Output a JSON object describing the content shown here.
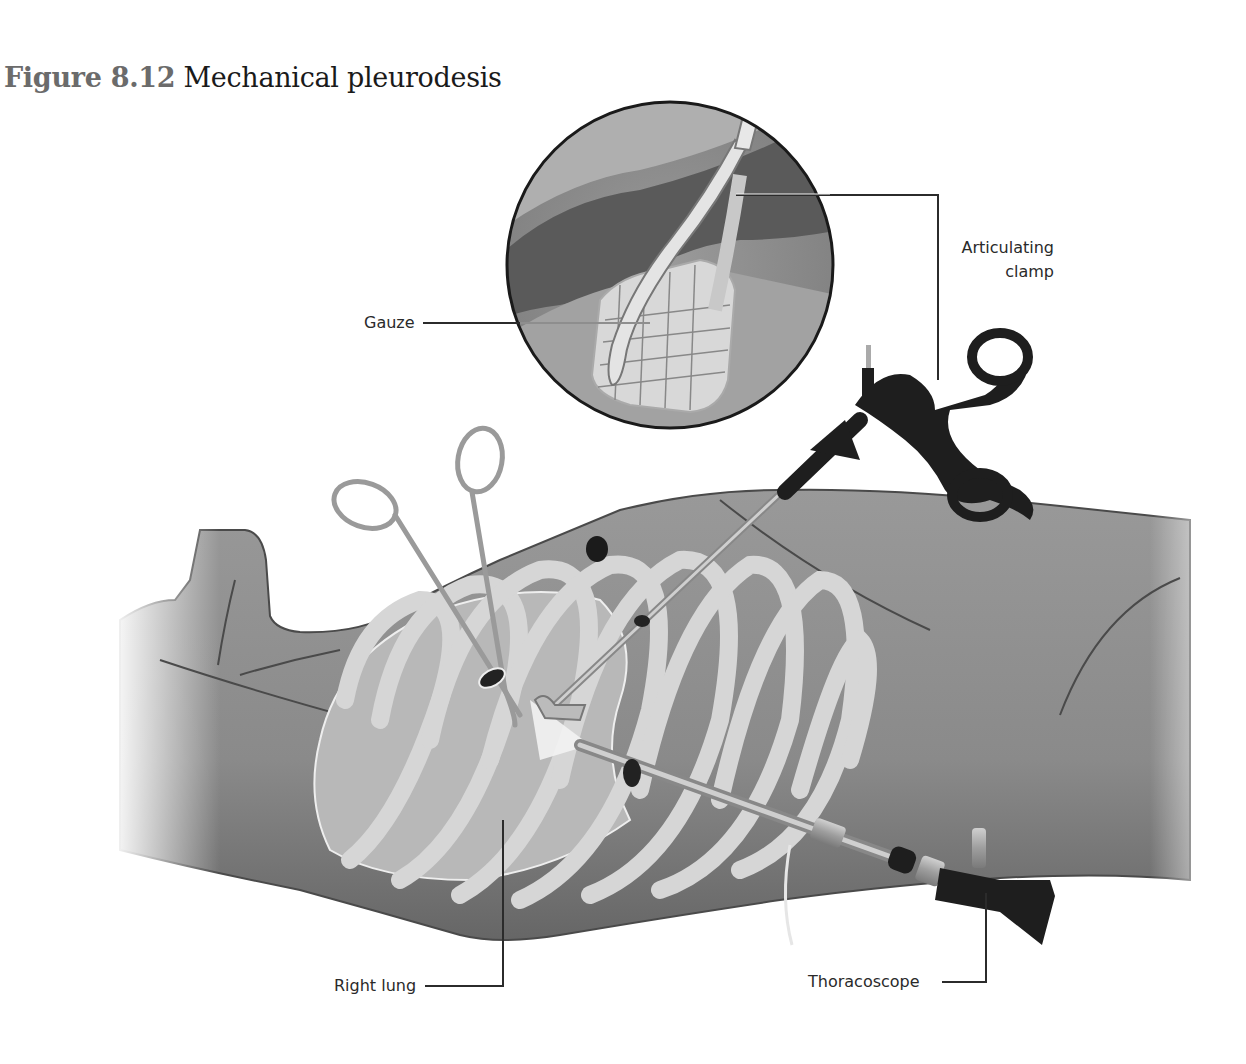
{
  "figure": {
    "number": "Figure 8.12",
    "title": "Mechanical pleurodesis"
  },
  "labels": {
    "articulating_clamp_line1": "Articulating",
    "articulating_clamp_line2": "clamp",
    "gauze": "Gauze",
    "right_lung": "Right lung",
    "thoracoscope": "Thoracoscope"
  },
  "colors": {
    "title_number": "#6b6b6b",
    "title_text": "#1a1a1a",
    "label_text": "#2a2a2a",
    "body_skin": "#8e8e8e",
    "body_dark": "#6e6e6e",
    "rib": "#d8d8d8",
    "lung": "#e6e6e6",
    "instrument_dark": "#1e1e1e",
    "instrument_metal": "#a9a9a9",
    "leader_line": "#2b2b2b"
  }
}
